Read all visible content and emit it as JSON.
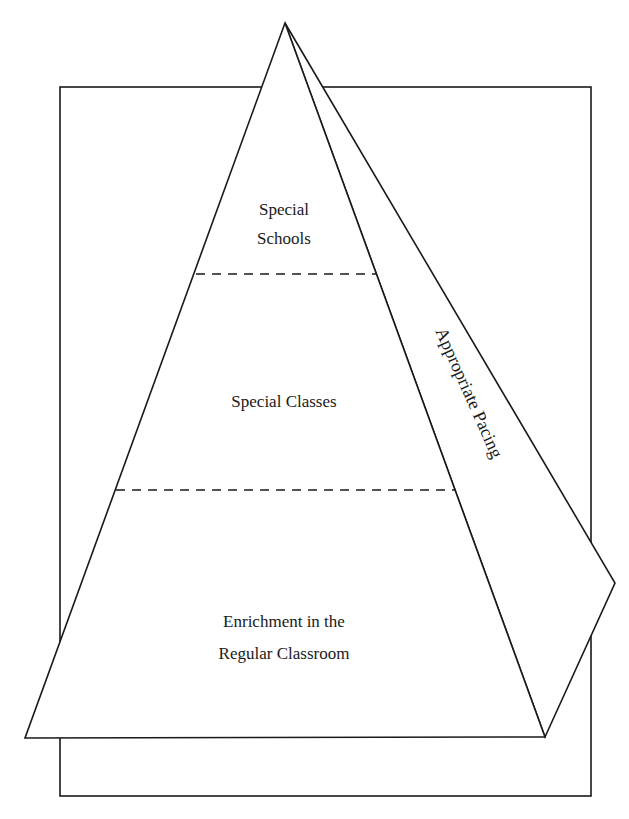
{
  "diagram": {
    "type": "pyramid",
    "tiers": [
      {
        "lines": [
          "Special",
          "Schools"
        ],
        "position": "top"
      },
      {
        "lines": [
          "Special Classes"
        ],
        "position": "middle"
      },
      {
        "lines": [
          "Enrichment in the",
          "Regular Classroom"
        ],
        "position": "bottom"
      }
    ],
    "side_face_label": "Appropriate Pacing",
    "tier_separator_style": "dashed",
    "colors": {
      "stroke": "#1a1a1a",
      "background": "#ffffff"
    }
  }
}
